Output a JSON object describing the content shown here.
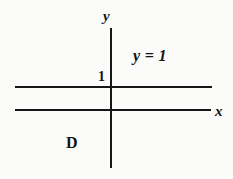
{
  "figure": {
    "background_color": "#fbfbfa",
    "stroke_color": "#161616",
    "text_color": "#141414",
    "width": 233,
    "height": 179
  },
  "axes": {
    "y_axis_label": "y",
    "x_axis_label": "x"
  },
  "ticks": {
    "y_tick_one": "1"
  },
  "annotations": {
    "line_equation": "y = 1",
    "region_label": "D"
  },
  "chart_data": {
    "type": "line",
    "title": "",
    "xlabel": "x",
    "ylabel": "y",
    "grid": false,
    "legend": "none",
    "xlim": [
      -2.45,
      2.55
    ],
    "ylim": [
      -1.5,
      2.05
    ],
    "series": [
      {
        "name": "x-axis",
        "kind": "axis",
        "orientation": "horizontal",
        "y": 0,
        "x": [
          -2.45,
          2.55
        ]
      },
      {
        "name": "y-axis",
        "kind": "axis",
        "orientation": "vertical",
        "x": 0,
        "y": [
          -1.45,
          2.05
        ]
      },
      {
        "name": "y = 1",
        "kind": "horizontal-line",
        "y": 1,
        "x": [
          -2.45,
          2.55
        ],
        "label": "y = 1"
      }
    ],
    "annotations": [
      {
        "text": "1",
        "x": -0.17,
        "y": 1.18
      },
      {
        "text": "y = 1",
        "x": 0.62,
        "y": 1.62
      },
      {
        "text": "D",
        "x": -0.55,
        "y": -0.55
      },
      {
        "text": "y",
        "x": -0.1,
        "y": 2.0
      },
      {
        "text": "x",
        "x": 2.6,
        "y": 0.12
      }
    ]
  }
}
